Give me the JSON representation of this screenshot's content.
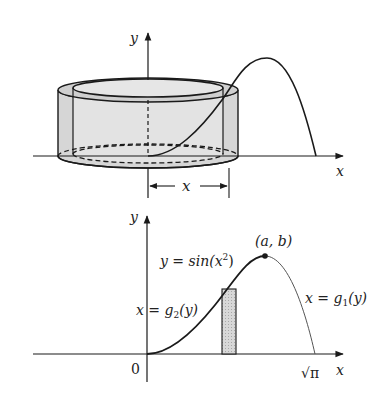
{
  "top_figure": {
    "y_axis_label": "y",
    "x_axis_label": "x",
    "dimension_label": "x",
    "description": "Cylindrical shell formed by rotating a thin vertical strip under y = sin(x^2) about the y-axis"
  },
  "bottom_figure": {
    "y_axis_label": "y",
    "x_axis_label": "x",
    "origin_label": "0",
    "x_end_label": "√π",
    "curve_label": "y = sin(x",
    "curve_label_exp": "2",
    "curve_label_close": ")",
    "point_label": "(a, b)",
    "left_branch_label": "x = g",
    "left_branch_sub": "2",
    "left_branch_tail": "(y)",
    "right_branch_label": "x = g",
    "right_branch_sub": "1",
    "right_branch_tail": "(y)"
  },
  "colors": {
    "line": "#1a1a1a",
    "shell_fill": "#d4d4d4",
    "strip_fill": "#cfcfcf"
  }
}
